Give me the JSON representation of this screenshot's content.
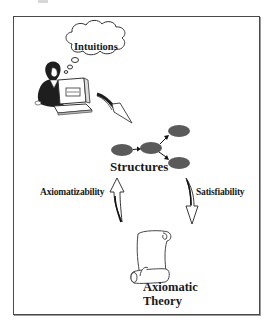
{
  "figure": {
    "nodes": {
      "intuitions": {
        "label": "Intuitions",
        "shape": "thought-cloud"
      },
      "structures": {
        "label": "Structures",
        "shape": "graph-of-ellipses",
        "ellipse_color": "#5a5a5a",
        "ellipse_count": 4
      },
      "theory": {
        "line1": "Axiomatic",
        "line2": "Theory",
        "shape": "scroll"
      }
    },
    "edges": {
      "intuitions_to_structures": {
        "label": "",
        "style": "curved-arrow"
      },
      "axiomatizability": {
        "label": "Axiomatizability",
        "direction": "bidirectional-up"
      },
      "satisfiability": {
        "label": "Satisfiability",
        "direction": "down"
      }
    },
    "colors": {
      "border": "#4a4a4a",
      "ellipse": "#5a5a5a",
      "text": "#1a1a1a",
      "background": "#ffffff"
    }
  }
}
